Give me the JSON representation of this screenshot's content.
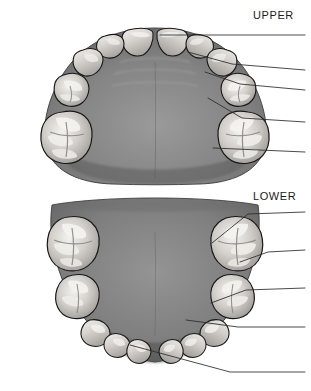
{
  "figure": {
    "background_color": "#ffffff",
    "width": 311,
    "height": 391
  },
  "labels": {
    "upper": "UPPER",
    "lower": "LOWER"
  },
  "palette": {
    "background": "#ffffff",
    "palate_mid": "#8a8a8a",
    "palate_dark": "#5e5e5e",
    "palate_light": "#a6a6a6",
    "tooth_light": "#e8e6e2",
    "tooth_mid": "#c9c6c1",
    "tooth_shadow": "#8e8b87",
    "outline": "#1b1b1b",
    "leader_line": "#2a2a2a",
    "text": "#1a1a1a"
  },
  "arches": [
    {
      "id": "upper",
      "name": "maxillary-arch",
      "label": "UPPER",
      "view": "occlusal",
      "tooth_count": 14,
      "leader_lines": [
        {
          "id": "u1",
          "target": "central-incisor",
          "x1": 160,
          "y1": 35,
          "x2": 305,
          "y2": 35
        },
        {
          "id": "u2",
          "target": "lateral-incisor",
          "x1": 188,
          "y1": 52,
          "x2": 305,
          "y2": 70
        },
        {
          "id": "u3",
          "target": "canine",
          "x1": 205,
          "y1": 72,
          "x2": 305,
          "y2": 90
        },
        {
          "id": "u4",
          "target": "premolar",
          "x1": 208,
          "y1": 98,
          "x2": 305,
          "y2": 122
        },
        {
          "id": "u5",
          "target": "molar",
          "x1": 213,
          "y1": 148,
          "x2": 305,
          "y2": 152
        }
      ]
    },
    {
      "id": "lower",
      "name": "mandibular-arch",
      "label": "LOWER",
      "view": "occlusal",
      "tooth_count": 14,
      "leader_lines": [
        {
          "id": "l1",
          "target": "second-molar",
          "x1": 212,
          "y1": 243,
          "x2": 305,
          "y2": 219
        },
        {
          "id": "l2",
          "target": "first-molar",
          "x1": 235,
          "y1": 262,
          "x2": 305,
          "y2": 256
        },
        {
          "id": "l3",
          "target": "premolar",
          "x1": 211,
          "y1": 303,
          "x2": 305,
          "y2": 288
        },
        {
          "id": "l4",
          "target": "canine",
          "x1": 186,
          "y1": 320,
          "x2": 305,
          "y2": 320
        },
        {
          "id": "l5",
          "target": "incisor",
          "x1": 130,
          "y1": 345,
          "x2": 305,
          "y2": 375
        }
      ]
    }
  ]
}
